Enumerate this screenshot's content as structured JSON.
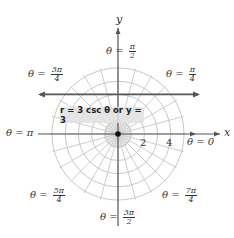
{
  "figure": {
    "type": "polar-coordinate-diagram",
    "center_px": [
      118,
      134
    ],
    "unit_px": 13.2,
    "circle_radii": [
      1,
      2,
      3,
      4,
      5
    ],
    "radial_line_step_deg": 15,
    "grid_color": "#c8c8c8",
    "axis_color": "#555555",
    "line_color": "#555555"
  },
  "axes": {
    "x_label": "x",
    "y_label": "y"
  },
  "ticks": {
    "t2": "2",
    "t4": "4"
  },
  "angle_labels": {
    "a0": {
      "prefix": "θ = ",
      "value": "0"
    },
    "a_pi4": {
      "prefix": "θ = ",
      "num": "π",
      "den": "4"
    },
    "a_pi2": {
      "prefix": "θ = ",
      "num": "π",
      "den": "2"
    },
    "a_3pi4": {
      "prefix": "θ = ",
      "num": "3π",
      "den": "4"
    },
    "a_pi": {
      "prefix": "θ = ",
      "value": "π"
    },
    "a_5pi4": {
      "prefix": "θ = ",
      "num": "5π",
      "den": "4"
    },
    "a_3pi2": {
      "prefix": "θ = ",
      "num": "3π",
      "den": "2"
    },
    "a_7pi4": {
      "prefix": "θ = ",
      "num": "7π",
      "den": "4"
    }
  },
  "equation": {
    "label": "r = 3 csc θ or y = 3",
    "line_y": 3
  }
}
